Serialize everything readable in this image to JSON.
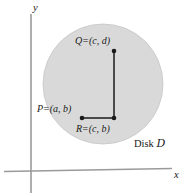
{
  "figure": {
    "background_color": "#ffffff",
    "axes": {
      "x_label": "x",
      "y_label": "y",
      "axis_color": "#9a9a9a",
      "origin": {
        "x": 31,
        "y": 171
      }
    },
    "disk": {
      "label_prefix": "Disk",
      "label_symbol": "D",
      "fill_color": "#d9d9d9",
      "edge_color": "#c4c4c4",
      "center": {
        "x": 103,
        "y": 84
      },
      "radius": 60
    },
    "points": [
      {
        "id": "Q",
        "label": "Q",
        "equals": "=",
        "coords": "(c, d)",
        "full_label": "Q = (c, d)",
        "x": 114,
        "y": 51
      },
      {
        "id": "P",
        "label": "P",
        "equals": "=",
        "coords": "(a, b)",
        "full_label": "P = (a, b)",
        "x": 82,
        "y": 118
      },
      {
        "id": "R",
        "label": "R",
        "equals": "=",
        "coords": "(c, b)",
        "full_label": "R = (c, b)",
        "x": 114,
        "y": 118
      }
    ],
    "segments": [
      {
        "from": "R",
        "to": "Q",
        "orientation": "vertical"
      },
      {
        "from": "P",
        "to": "R",
        "orientation": "horizontal"
      }
    ],
    "segment_color": "#1a1a1a"
  }
}
